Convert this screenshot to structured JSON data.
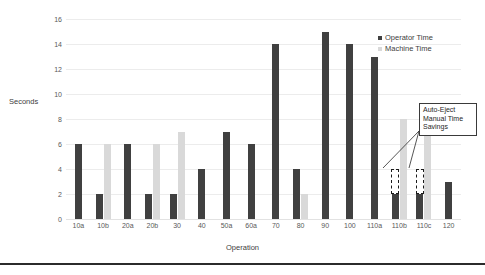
{
  "chart_data": {
    "type": "bar",
    "title": "",
    "xlabel": "Operation",
    "ylabel": "Seconds",
    "ylim": [
      0,
      16
    ],
    "ytick_step": 2,
    "yticks": [
      16,
      14,
      12,
      10,
      8,
      6,
      4,
      2,
      0
    ],
    "grid": true,
    "legend_position": "top-right",
    "categories": [
      "10a",
      "10b",
      "20a",
      "20b",
      "30",
      "40",
      "50a",
      "60a",
      "70",
      "80",
      "90",
      "100",
      "110a",
      "110b",
      "110c",
      "120"
    ],
    "series": [
      {
        "name": "Operator Time",
        "color": "#404040",
        "values": [
          6,
          2,
          6,
          2,
          2,
          4,
          7,
          6,
          14,
          4,
          15,
          14,
          13,
          2,
          2,
          3
        ]
      },
      {
        "name": "Machine Time",
        "color": "#d9d9d9",
        "values": [
          0,
          6,
          0,
          6,
          7,
          0,
          0,
          0,
          0,
          2,
          0,
          0,
          0,
          8,
          8,
          0
        ]
      }
    ],
    "annotations": [
      {
        "name": "auto-eject-savings",
        "lines": [
          "Auto-Eject",
          "Manual Time",
          "Savings"
        ],
        "targets": [
          "110b",
          "110c"
        ],
        "target_range": [
          2,
          4
        ],
        "style": "dashed-box-with-leader-lines"
      }
    ]
  },
  "legend": {
    "items": [
      {
        "label": "Operator Time",
        "swatch": "operator"
      },
      {
        "label": "Machine Time",
        "swatch": "machine"
      }
    ]
  },
  "axes": {
    "y_title": "Seconds",
    "x_title": "Operation"
  },
  "colors": {
    "operator": "#404040",
    "machine": "#d9d9d9",
    "gridline": "#ececec",
    "callout_border": "#3a3a3a",
    "rule": "#2b2b2b",
    "background": "#ffffff"
  }
}
